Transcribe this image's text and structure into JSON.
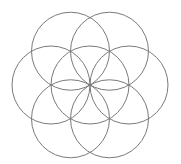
{
  "diagram": {
    "stroke_color": "#7a7a7a",
    "background": "#ffffff",
    "center": {
      "x": 90,
      "y": 85
    },
    "radius": 39,
    "circles": [
      {
        "name": "center-circle",
        "dx": 0,
        "dy": 0
      },
      {
        "name": "top-left-circle",
        "angle": 240
      },
      {
        "name": "top-right-circle",
        "angle": 300
      },
      {
        "name": "right-circle",
        "angle": 0
      },
      {
        "name": "bottom-right-circle",
        "angle": 60
      },
      {
        "name": "bottom-left-circle",
        "angle": 120
      },
      {
        "name": "left-circle",
        "angle": 180
      }
    ]
  }
}
